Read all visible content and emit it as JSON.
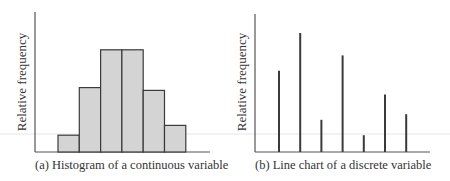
{
  "chart_data": [
    {
      "type": "bar",
      "subtype": "histogram",
      "title": "",
      "caption": "(a)  Histogram of a continuous variable",
      "xlabel": "",
      "ylabel": "Relative frequency",
      "categories": [
        "bin1",
        "bin2",
        "bin3",
        "bin4",
        "bin5",
        "bin6"
      ],
      "values": [
        0.12,
        0.46,
        0.73,
        0.73,
        0.44,
        0.19
      ],
      "ylim": [
        0,
        1
      ],
      "grid": false,
      "legend": "none",
      "colors": {
        "fill": "#d4d4d4",
        "stroke": "#3a3a3a"
      }
    },
    {
      "type": "bar",
      "subtype": "line-chart-stems",
      "title": "",
      "caption": "(b)  Line chart of a discrete variable",
      "xlabel": "",
      "ylabel": "Relative frequency",
      "categories": [
        "x1",
        "x2",
        "x3",
        "x4",
        "x5",
        "x6",
        "x7"
      ],
      "values": [
        0.58,
        0.85,
        0.23,
        0.69,
        0.12,
        0.41,
        0.27
      ],
      "ylim": [
        0,
        1
      ],
      "grid": false,
      "legend": "none",
      "colors": {
        "stroke": "#3a3a3a"
      }
    }
  ]
}
